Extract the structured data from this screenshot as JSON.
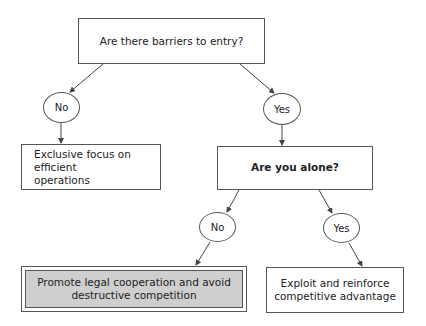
{
  "diagram": {
    "root": {
      "label": "Are there barriers to entry?"
    },
    "branch_no": {
      "label": "No"
    },
    "branch_yes": {
      "label": "Yes"
    },
    "outcome_no_barriers": {
      "label_line1": "Exclusive focus on efficient",
      "label_line2": "operations"
    },
    "question_alone": {
      "label": "Are you alone?"
    },
    "alone_no": {
      "label": "No"
    },
    "alone_yes": {
      "label": "Yes"
    },
    "outcome_not_alone": {
      "label_line1": "Promote legal cooperation and avoid",
      "label_line2": "destructive competition",
      "fill": "#cfcfcf"
    },
    "outcome_alone": {
      "label_line1": "Exploit and reinforce",
      "label_line2": "competitive advantage"
    }
  }
}
